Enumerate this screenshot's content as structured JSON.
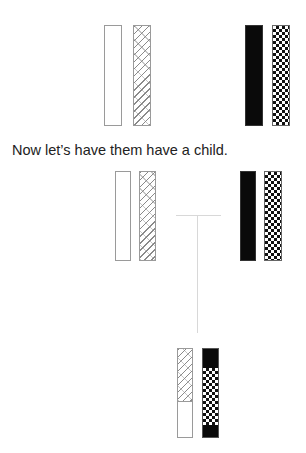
{
  "caption": "Now let’s have them have a child.",
  "colors": {
    "bar_border": "#9a9a9a",
    "black_fill": "#0a0a0a",
    "hatch_line": "#8a8a8a",
    "connector": "#d8d8d8",
    "text": "#222222"
  },
  "parents_top": {
    "parent_a": {
      "chromosomes": [
        "white",
        "hatched"
      ]
    },
    "parent_b": {
      "chromosomes": [
        "black",
        "checkered"
      ]
    }
  },
  "parents_second": {
    "parent_a": {
      "chromosomes": [
        "white",
        "hatched"
      ]
    },
    "parent_b": {
      "chromosomes": [
        "black",
        "checkered"
      ]
    }
  },
  "child": {
    "chromosome_1": {
      "segments": [
        "hatched",
        "white"
      ]
    },
    "chromosome_2": {
      "segments": [
        "black",
        "checkered",
        "black"
      ]
    }
  }
}
